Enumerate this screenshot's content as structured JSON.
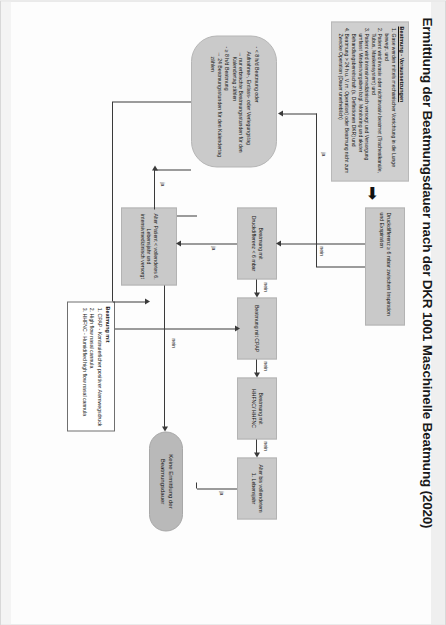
{
  "document": {
    "title": "Ermittlung der Beatmungsdauer nach der DKR 1001 Maschinelle Beatmung (2020)",
    "orientation": "rotated-90",
    "language": "de"
  },
  "legend_box": {
    "heading": "Beatmung - Voraussetzungen",
    "items": [
      "Gase werden mittels mechanischer Vorrichtung in die Lunge bewegt. und",
      "Patient wird invasiv oder nichtinvasiv beatmet (Trachealkanüle, Tubus, Maskensystem) und",
      "Patient wird intensivmedizinisch versorgt und Versorgung umfasst Mindestvorgaben bzgl. Monitoring und akuter Behandlungsbereitschaft (s. Definitionen DKR) und",
      "Beatmung > 24 h u. V. m. Operation) oder Beatmung nicht zum Zwecke Operation (Dauer unerheblich)"
    ]
  },
  "beatmung_mit_box": {
    "heading": "Beatmung mit",
    "items": [
      "CPAP - Kontinuierlicher positiver Atemwegsdruck",
      "High flow nasal cannula",
      "HHFNC - Humidified high flow nasal cannula"
    ]
  },
  "nodes": {
    "alter_patient": "Alter Patient < vollendetes 6. Lebensjahr und intensivmedizinisch versorgt",
    "keine_ermittlung": "Keine Ermittlung der Beatmungsdauer",
    "beatmung_druckdifferenz": "Beatmung mit Druckdifferenz < 6 mbar",
    "beatmung_cpap": "Beatmung mit CPAP",
    "beatmung_hhfnc": "Beatmung mit HHFNC/ HHFNC",
    "alter_vollendetes": "Alter bis vollendetem 1. Lebensjahr",
    "druckdifferenz": "Druckdifferenz ≥ 6 mbar zwischen Inspiration und Exspiration",
    "kriterien": "- < 8 h/d Beatmung oder\n   Aufnahme-, Entlass- oder Verlegungstag\n   → nur erbrachte Beatmungsstunden für den Kalendertag zählen\n- ≥ 8 h/d Beatmung\n   → 24 Beatmungsstunden für den Kalendertag zählen"
  },
  "kriterien_lines": [
    "- < 8 h/d Beatmung oder",
    "Aufnahme-, Entlass- oder Verlegungstag",
    "→ nur erbrachte Beatmungsstunden für den Kalendertag zählen",
    "- ≥ 8 h/d Beatmung",
    "→ 24 Beatmungsstunden für den Kalendertag zählen"
  ],
  "edge_labels": {
    "ja": "ja",
    "nein": "nein"
  },
  "colors": {
    "node_fill": "#c9c9c9",
    "terminal_fill": "#b9b9b9",
    "line": "#3a3a3a",
    "page": "#fdfdfd",
    "text": "#141414"
  }
}
